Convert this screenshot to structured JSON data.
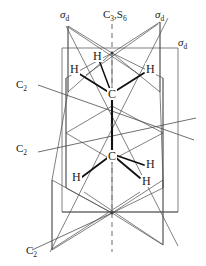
{
  "figure": {
    "colors": {
      "line": "#3a3a3a",
      "bond": "#111111",
      "axis": "#6e6e6e",
      "text": "#1a1a1a",
      "background": "#ffffff"
    }
  },
  "labels": {
    "sigma_d_top_left": {
      "text": "σ",
      "sub": "d"
    },
    "sigma_d_top_right": {
      "text": "σ",
      "sub": "d"
    },
    "sigma_d_right": {
      "text": "σ",
      "sub": "d"
    },
    "principal_axis": {
      "text": "C",
      "sub1": "3",
      "mid": ",S",
      "sub2": "6"
    },
    "c2_upper_left": {
      "text": "C",
      "sub": "2"
    },
    "c2_mid_left": {
      "text": "C",
      "sub": "2"
    },
    "c2_bottom_left": {
      "text": "C",
      "sub": "2"
    }
  },
  "atoms": {
    "carbon_top": "C",
    "carbon_bottom": "C",
    "hydrogen_top_1": "H",
    "hydrogen_top_2": "H",
    "hydrogen_top_3": "H",
    "hydrogen_bottom_1": "H",
    "hydrogen_bottom_2": "H",
    "hydrogen_bottom_3": "H"
  }
}
